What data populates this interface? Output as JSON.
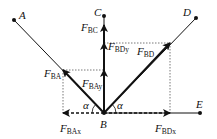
{
  "diagram": {
    "title": "",
    "points": {
      "A": {
        "label": "A",
        "x": 14,
        "y": 20
      },
      "B": {
        "label": "B",
        "x": 104,
        "y": 113
      },
      "C": {
        "label": "C",
        "x": 104,
        "y": 16
      },
      "D": {
        "label": "D",
        "x": 196,
        "y": 18
      },
      "E": {
        "label": "E",
        "x": 200,
        "y": 113
      }
    },
    "forces": {
      "F_BA": {
        "main": "F",
        "sub": "BA"
      },
      "F_BAy": {
        "main": "F",
        "sub": "BAy"
      },
      "F_BAx": {
        "main": "F",
        "sub": "BAx"
      },
      "F_BC": {
        "main": "F",
        "sub": "BC"
      },
      "F_BD": {
        "main": "F",
        "sub": "BD"
      },
      "F_BDy": {
        "main": "F",
        "sub": "BDy"
      },
      "F_BDx": {
        "main": "F",
        "sub": "BDx"
      }
    },
    "angles": {
      "left": "α",
      "right": "α"
    },
    "colors": {
      "line": "#111111",
      "dashed": "#555555"
    }
  }
}
